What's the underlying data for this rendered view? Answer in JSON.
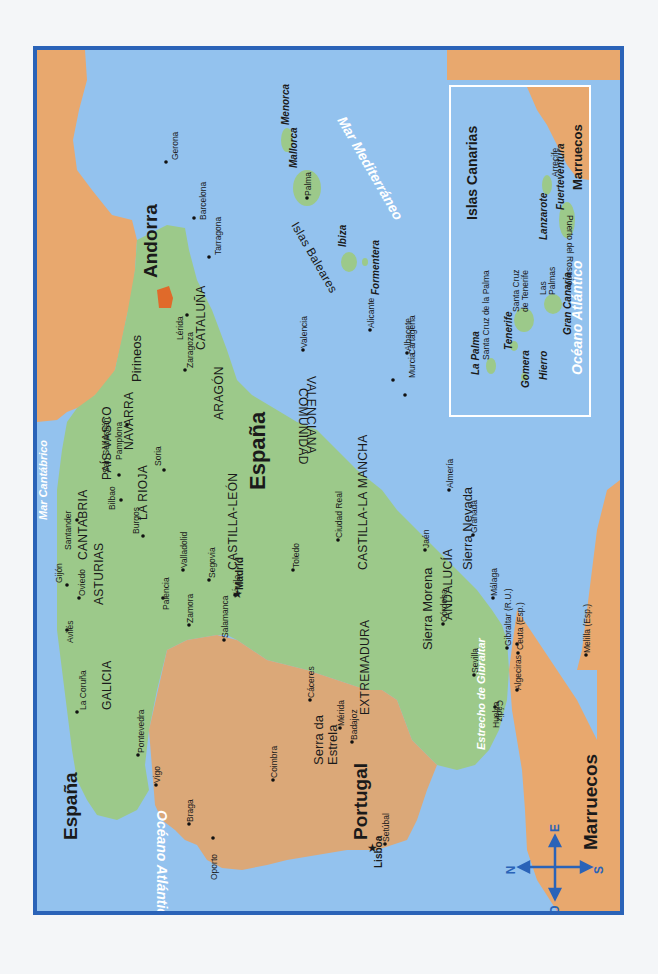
{
  "map": {
    "title_countries": {
      "espana_corner": "España",
      "espana_center": "España",
      "portugal": "Portugal",
      "andorra": "Andorra",
      "marruecos": "Marruecos",
      "marruecos_inset": "Marruecos"
    },
    "colors": {
      "sea": "#93c2ee",
      "spain_land": "#9cc98a",
      "foreign_land": "#e8a86e",
      "portugal_land": "#dba878",
      "andorra": "#e06a2a",
      "frame": "#2a63b8",
      "inset_border": "#ffffff",
      "compass": "#2a63b8"
    },
    "regions": [
      "GALICIA",
      "ASTURIAS",
      "CANTABRIA",
      "PAÍS VASCO",
      "NAVARRA",
      "LA RIOJA",
      "ARAGÓN",
      "CATALUÑA",
      "CASTILLA-LEÓN",
      "CASTILLA-LA MANCHA",
      "EXTREMADURA",
      "ANDALUCÍA",
      "COMUNIDAD",
      "VALENCIANA"
    ],
    "cities": [
      "Gerona",
      "Barcelona",
      "Tarragona",
      "Lérida",
      "Zaragoza",
      "Pamplona",
      "San Sebastián",
      "Bilbao",
      "Santander",
      "Gijón",
      "Oviedo",
      "Avilés",
      "La Coruña",
      "Pontevedra",
      "Vigo",
      "Soria",
      "Burgos",
      "Palencia",
      "Valladolid",
      "Zamora",
      "Salamanca",
      "Segovia",
      "Ávila",
      "Madrid",
      "Toledo",
      "Cáceres",
      "Mérida",
      "Badajoz",
      "Ciudad Real",
      "Valencia",
      "Alicante",
      "Albacete",
      "Murcia",
      "Cartagena",
      "Almería",
      "Granada",
      "Jaén",
      "Córdoba",
      "Sevilla",
      "Huelva",
      "Cádiz",
      "Málaga",
      "Gibraltar (R.U.)",
      "Algeciras",
      "Ceuta (Esp.)",
      "Melilla (Esp.)",
      "Braga",
      "Oporto",
      "Coimbra",
      "Lisboa",
      "Setúbal",
      "Palma"
    ],
    "mountains": [
      "Pirineos",
      "Sierra Morena",
      "Sierra Nevada",
      "Serra da",
      "Estrela"
    ],
    "seas": {
      "cantabrico": "Mar Cantábrico",
      "atlantico": "Océano Atlántico",
      "mediterraneo": "Mar Mediterráneo",
      "gibraltar": "Estrecho de Gibraltar",
      "atlantico_inset": "Océano Atlántico"
    },
    "baleares": {
      "group": "Islas Baleares",
      "islands": [
        "Menorca",
        "Mallorca",
        "Ibiza",
        "Formentera"
      ]
    },
    "canarias_inset": {
      "title": "Islas Canarias",
      "islands": [
        "La Palma",
        "Tenerife",
        "Gomera",
        "Hierro",
        "Gran Canaria",
        "Lanzarote",
        "Fuerteventura"
      ],
      "cities": [
        "Santa Cruz de la Palma",
        "Santa Cruz",
        "de Tenerife",
        "Las",
        "Palmas",
        "Arrecife",
        "Puerto del Rosario"
      ]
    },
    "compass": {
      "n": "N",
      "s": "S",
      "e": "E",
      "o": "O"
    }
  }
}
